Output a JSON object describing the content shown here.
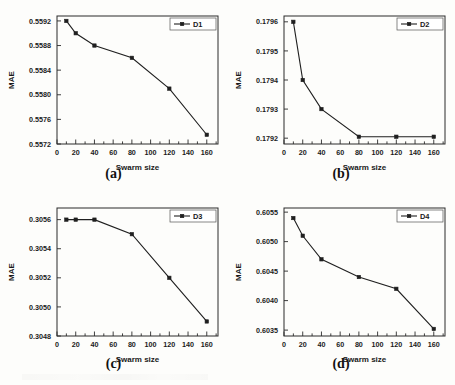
{
  "figure": {
    "background": "#fdfdfb",
    "line_color": "#1f1f1f",
    "axis_color": "#2a2a2a",
    "panel_captions": [
      "(a)",
      "(b)",
      "(c)",
      "(d)"
    ]
  },
  "chart_data": [
    {
      "type": "line",
      "title": "",
      "panel_label": "(a)",
      "xlabel": "Swarm size",
      "ylabel": "MAE",
      "legend": [
        "D1"
      ],
      "legend_position": "top-right",
      "grid": false,
      "xlim": [
        0,
        172
      ],
      "ylim": [
        0.5572,
        0.55928
      ],
      "xticks": [
        0,
        20,
        40,
        60,
        80,
        100,
        120,
        140,
        160
      ],
      "xticklabels": [
        "0",
        "20",
        "40",
        "60",
        "80",
        "100",
        "120",
        "140",
        "160"
      ],
      "yticks": [
        0.5572,
        0.5576,
        0.558,
        0.5584,
        0.5588,
        0.5592
      ],
      "yticklabels": [
        "0.5572",
        "0.5576",
        "0.5580",
        "0.5584",
        "0.5588",
        "0.5592"
      ],
      "x": [
        10,
        20,
        40,
        80,
        120,
        160
      ],
      "series": [
        {
          "name": "D1",
          "values": [
            0.5592,
            0.559,
            0.5588,
            0.5586,
            0.5581,
            0.55735
          ]
        }
      ]
    },
    {
      "type": "line",
      "title": "",
      "panel_label": "(b)",
      "xlabel": "Swarm size",
      "ylabel": "MAE",
      "legend": [
        "D2"
      ],
      "legend_position": "top-right",
      "grid": false,
      "xlim": [
        0,
        172
      ],
      "ylim": [
        0.17918,
        0.17962
      ],
      "xticks": [
        0,
        20,
        40,
        60,
        80,
        100,
        120,
        140,
        160
      ],
      "xticklabels": [
        "0",
        "20",
        "40",
        "60",
        "80",
        "100",
        "120",
        "140",
        "160"
      ],
      "yticks": [
        0.1792,
        0.1793,
        0.1794,
        0.1795,
        0.1796
      ],
      "yticklabels": [
        "0.1792",
        "0.1793",
        "0.1794",
        "0.1795",
        "0.1796"
      ],
      "x": [
        10,
        20,
        40,
        80,
        120,
        160
      ],
      "series": [
        {
          "name": "D2",
          "values": [
            0.1796,
            0.1794,
            0.1793,
            0.179205,
            0.179205,
            0.179205
          ]
        }
      ]
    },
    {
      "type": "line",
      "title": "",
      "panel_label": "(c)",
      "xlabel": "Swarm size",
      "ylabel": "MAE",
      "legend": [
        "D3"
      ],
      "legend_position": "top-right",
      "grid": false,
      "xlim": [
        0,
        172
      ],
      "ylim": [
        0.3048,
        0.30568
      ],
      "xticks": [
        0,
        20,
        40,
        60,
        80,
        100,
        120,
        140,
        160
      ],
      "xticklabels": [
        "0",
        "20",
        "40",
        "60",
        "80",
        "100",
        "120",
        "140",
        "160"
      ],
      "yticks": [
        0.3048,
        0.305,
        0.3052,
        0.3054,
        0.3056
      ],
      "yticklabels": [
        "0.3048",
        "0.3050",
        "0.3052",
        "0.3054",
        "0.3056"
      ],
      "x": [
        10,
        20,
        40,
        80,
        120,
        160
      ],
      "series": [
        {
          "name": "D3",
          "values": [
            0.3056,
            0.3056,
            0.3056,
            0.3055,
            0.3052,
            0.3049
          ]
        }
      ]
    },
    {
      "type": "line",
      "title": "",
      "panel_label": "(d)",
      "xlabel": "Swarm size",
      "ylabel": "MAE",
      "legend": [
        "D4"
      ],
      "legend_position": "top-right",
      "grid": false,
      "xlim": [
        0,
        172
      ],
      "ylim": [
        0.6034,
        0.60557
      ],
      "xticks": [
        0,
        20,
        40,
        60,
        80,
        100,
        120,
        140,
        160
      ],
      "xticklabels": [
        "0",
        "20",
        "40",
        "60",
        "80",
        "100",
        "120",
        "140",
        "160"
      ],
      "yticks": [
        0.6035,
        0.604,
        0.6045,
        0.605,
        0.6055
      ],
      "yticklabels": [
        "0.6035",
        "0.6040",
        "0.6045",
        "0.6050",
        "0.6055"
      ],
      "x": [
        10,
        20,
        40,
        80,
        120,
        160
      ],
      "series": [
        {
          "name": "D4",
          "values": [
            0.6054,
            0.6051,
            0.6047,
            0.6044,
            0.6042,
            0.60352
          ]
        }
      ]
    }
  ]
}
